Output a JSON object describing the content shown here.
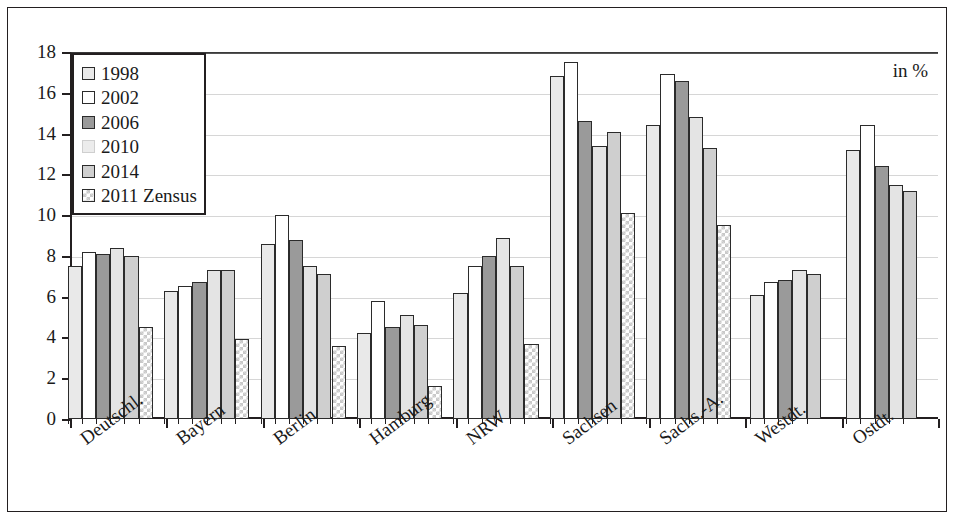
{
  "unit_note": "in %",
  "legend": {
    "items": [
      {
        "label": "1998",
        "key": "s1998"
      },
      {
        "label": "2002",
        "key": "s2002"
      },
      {
        "label": "2006",
        "key": "s2006"
      },
      {
        "label": "2010",
        "key": "s2010"
      },
      {
        "label": "2014",
        "key": "s2014"
      },
      {
        "label": "2011 Zensus",
        "key": "szensus"
      }
    ]
  },
  "chart_data": {
    "type": "bar",
    "title": "",
    "xlabel": "",
    "ylabel": "",
    "unit": "in %",
    "ylim": [
      0,
      18
    ],
    "yticks": [
      0,
      2,
      4,
      6,
      8,
      10,
      12,
      14,
      16,
      18
    ],
    "grid": true,
    "legend_position": "top-left",
    "categories": [
      "Deutschl.",
      "Bayern",
      "Berlin",
      "Hamburg",
      "NRW",
      "Sachsen",
      "Sachs.-A.",
      "Westdt.",
      "Ostdt."
    ],
    "series": [
      {
        "name": "1998",
        "key": "s1998",
        "color": "#e9e9e9",
        "values": [
          7.5,
          6.3,
          8.6,
          4.2,
          6.2,
          16.8,
          14.4,
          6.1,
          13.2
        ]
      },
      {
        "name": "2002",
        "key": "s2002",
        "color": "#ffffff",
        "values": [
          8.2,
          6.5,
          10.0,
          5.8,
          7.5,
          17.5,
          16.9,
          6.7,
          14.4
        ]
      },
      {
        "name": "2006",
        "key": "s2006",
        "color": "#9a9a9a",
        "values": [
          8.1,
          6.7,
          8.8,
          4.5,
          8.0,
          14.6,
          16.6,
          6.8,
          12.4
        ]
      },
      {
        "name": "2010",
        "key": "s2010",
        "color": "#e4e4e4",
        "values": [
          8.4,
          7.3,
          7.5,
          5.1,
          8.9,
          13.4,
          14.8,
          7.3,
          11.5
        ]
      },
      {
        "name": "2014",
        "key": "s2014",
        "color": "#cfcfcf",
        "values": [
          8.0,
          7.3,
          7.1,
          4.6,
          7.5,
          14.1,
          13.3,
          7.1,
          11.2
        ]
      },
      {
        "name": "2011 Zensus",
        "key": "szensus",
        "color": "#ffffff",
        "values": [
          4.5,
          3.9,
          3.6,
          1.6,
          3.7,
          10.1,
          9.5,
          null,
          null
        ]
      }
    ]
  }
}
